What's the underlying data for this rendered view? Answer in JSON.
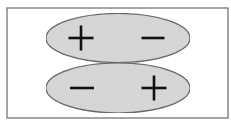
{
  "diagram": {
    "title": "",
    "frame": {
      "x": 7,
      "y": 8,
      "w": 221,
      "h": 110,
      "stroke": "#6a6a6a"
    },
    "lobes": [
      {
        "name": "top-lobe",
        "cx": 118,
        "cy": 38,
        "rx": 72,
        "ry": 24.5,
        "fill": "#d9d9d9",
        "stroke": "#555555",
        "signs": [
          {
            "type": "plus",
            "cx": 81,
            "cy": 38,
            "half": 12.5
          },
          {
            "type": "minus",
            "cx": 153,
            "cy": 38,
            "half": 11.5
          }
        ]
      },
      {
        "name": "bottom-lobe",
        "cx": 118,
        "cy": 88,
        "rx": 72,
        "ry": 25,
        "fill": "#d9d9d9",
        "stroke": "#555555",
        "signs": [
          {
            "type": "minus",
            "cx": 82,
            "cy": 88,
            "half": 12
          },
          {
            "type": "plus",
            "cx": 154,
            "cy": 88,
            "half": 12.5
          }
        ]
      }
    ],
    "sign_color": "#111111"
  }
}
